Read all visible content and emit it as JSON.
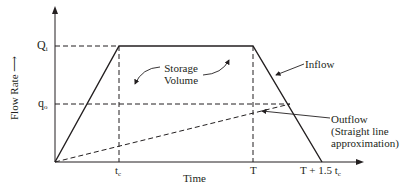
{
  "diagram": {
    "axes": {
      "y_label": "Flow Rate",
      "x_label": "Time",
      "y_ticks": [
        {
          "base": "Q",
          "sub": "i"
        },
        {
          "base": "q",
          "sub": "o"
        }
      ],
      "x_ticks": [
        {
          "base": "t",
          "sub": "c"
        },
        {
          "base": "T",
          "sub": ""
        },
        {
          "base": "T + 1.5 t",
          "sub": "c"
        }
      ]
    },
    "annotations": {
      "storage_line1": "Storage",
      "storage_line2": "Volume",
      "inflow": "Inflow",
      "outflow_line1": "Outflow",
      "outflow_line2": "(Straight line",
      "outflow_line3": "approximation)"
    },
    "colors": {
      "line": "#231f20",
      "background": "#ffffff"
    }
  }
}
